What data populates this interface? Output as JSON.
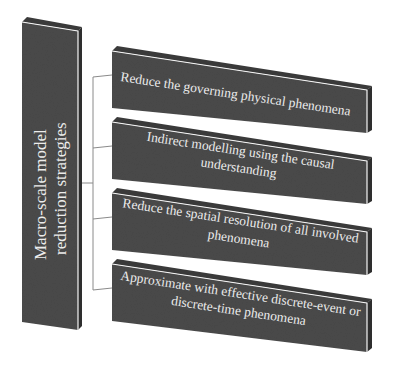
{
  "diagram": {
    "root": {
      "line1": "Macro-scale model",
      "line2": "reduction strategies"
    },
    "strategies": [
      {
        "lines": [
          "Reduce the governing physical phenomena"
        ]
      },
      {
        "lines": [
          "Indirect modelling using the causal",
          "understanding"
        ]
      },
      {
        "lines": [
          "Reduce the spatial resolution of all involved",
          "phenomena"
        ]
      },
      {
        "lines": [
          "Approximate with effective discrete-event or",
          "discrete-time phenomena"
        ]
      }
    ],
    "colors": {
      "box_face": "#4a4a4a",
      "box_top": "#3a3a3a",
      "box_side": "#2e2e2e",
      "edge_highlight": "#f5f5f5",
      "text": "#ececec",
      "connector": "#8a8a8a"
    }
  }
}
